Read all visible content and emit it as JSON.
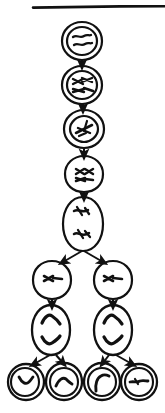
{
  "page": {
    "title": "Cell division stages diagram",
    "background_color": "#ffffff",
    "ink_color": "#111111",
    "width": 165,
    "height": 413
  },
  "divider": {
    "name": "top-horizontal-rule",
    "x1": 33,
    "x2": 165,
    "y": 7,
    "thickness": 2.4,
    "color": "#111111"
  },
  "diagram": {
    "type": "flow",
    "style": "hand-drawn line art",
    "stage_count": 9,
    "arrow_count": 12,
    "stages": [
      {
        "id": "stage-1",
        "label": "interphase-cell",
        "shape": "double-circle",
        "cx": 82,
        "cy": 41,
        "rx": 20,
        "ry": 19,
        "inner_rx": 15,
        "inner_ry": 14,
        "contents": "two-squiggly-chromatin-strands",
        "row": 1,
        "column": 1
      },
      {
        "id": "stage-2",
        "label": "prophase-cell",
        "shape": "double-circle",
        "cx": 82,
        "cy": 85,
        "rx": 20,
        "ry": 19,
        "inner_rx": 15,
        "inner_ry": 14,
        "contents": "four-condensing-chromosomes",
        "row": 2,
        "column": 1
      },
      {
        "id": "stage-3",
        "label": "prometaphase-cell",
        "shape": "double-circle",
        "cx": 84,
        "cy": 129,
        "rx": 20,
        "ry": 19,
        "inner_rx": 14,
        "inner_ry": 13,
        "contents": "paired-chromosomes-crossing",
        "row": 3,
        "column": 1
      },
      {
        "id": "stage-4",
        "label": "metaphase-cell",
        "shape": "single-circle",
        "cx": 84,
        "cy": 174,
        "rx": 19,
        "ry": 18,
        "contents": "chromosomes-aligned-at-equator",
        "row": 4,
        "column": 1
      },
      {
        "id": "stage-5",
        "label": "anaphase-cell",
        "shape": "vertical-oval",
        "cx": 83,
        "cy": 224,
        "rx": 20,
        "ry": 27,
        "contents": "two-chromosome-sets-separating",
        "row": 5,
        "column": 1
      },
      {
        "id": "stage-6",
        "label": "daughter-cell-left",
        "shape": "single-circle",
        "cx": 52,
        "cy": 280,
        "rx": 19,
        "ry": 19,
        "contents": "chromosome-pair-at-equator",
        "row": 6,
        "column": 1
      },
      {
        "id": "stage-7",
        "label": "daughter-cell-right",
        "shape": "single-circle",
        "cx": 113,
        "cy": 280,
        "rx": 19,
        "ry": 19,
        "contents": "chromosome-pair-at-equator",
        "row": 6,
        "column": 2
      },
      {
        "id": "stage-8",
        "label": "dividing-cell-left",
        "shape": "vertical-oval",
        "cx": 51,
        "cy": 330,
        "rx": 19,
        "ry": 25,
        "contents": "two-arc-chromosome-groups",
        "row": 7,
        "column": 1
      },
      {
        "id": "stage-9",
        "label": "dividing-cell-right",
        "shape": "vertical-oval",
        "cx": 113,
        "cy": 330,
        "rx": 19,
        "ry": 25,
        "contents": "two-arc-chromosome-groups",
        "row": 7,
        "column": 2
      }
    ],
    "gametes": [
      {
        "id": "gamete-1",
        "label": "haploid-cell-1",
        "shape": "double-circle",
        "cx": 26,
        "cy": 382,
        "rx": 18,
        "ry": 18,
        "inner_rx": 13,
        "inner_ry": 13,
        "contents": "single-v-shaped-chromosome",
        "row": 8,
        "column": 1
      },
      {
        "id": "gamete-2",
        "label": "haploid-cell-2",
        "shape": "double-circle",
        "cx": 64,
        "cy": 382,
        "rx": 18,
        "ry": 18,
        "inner_rx": 13,
        "inner_ry": 13,
        "contents": "single-caret-shaped-chromosome",
        "row": 8,
        "column": 2
      },
      {
        "id": "gamete-3",
        "label": "haploid-cell-3",
        "shape": "double-circle",
        "cx": 102,
        "cy": 382,
        "rx": 18,
        "ry": 18,
        "inner_rx": 13,
        "inner_ry": 13,
        "contents": "single-hook-shaped-chromosome",
        "row": 8,
        "column": 3
      },
      {
        "id": "gamete-4",
        "label": "haploid-cell-4",
        "shape": "double-circle",
        "cx": 139,
        "cy": 382,
        "rx": 18,
        "ry": 18,
        "inner_rx": 13,
        "inner_ry": 13,
        "contents": "single-horizontal-chromosome",
        "row": 8,
        "column": 4
      }
    ],
    "arrows": [
      {
        "id": "arrow-1",
        "from": "stage-1",
        "to": "stage-2",
        "x1": 82,
        "y1": 60,
        "x2": 82,
        "y2": 65
      },
      {
        "id": "arrow-2",
        "from": "stage-2",
        "to": "stage-3",
        "x1": 83,
        "y1": 104,
        "x2": 83,
        "y2": 109
      },
      {
        "id": "arrow-3",
        "from": "stage-3",
        "to": "stage-4",
        "x1": 84,
        "y1": 148,
        "x2": 84,
        "y2": 155
      },
      {
        "id": "arrow-4",
        "from": "stage-4",
        "to": "stage-5",
        "x1": 84,
        "y1": 192,
        "x2": 84,
        "y2": 197
      },
      {
        "id": "arrow-5",
        "from": "stage-5",
        "to": "stage-6",
        "x1": 83,
        "y1": 251,
        "x2": 62,
        "y2": 262
      },
      {
        "id": "arrow-6",
        "from": "stage-5",
        "to": "stage-7",
        "x1": 83,
        "y1": 251,
        "x2": 104,
        "y2": 262
      },
      {
        "id": "arrow-7",
        "from": "stage-6",
        "to": "stage-8",
        "x1": 52,
        "y1": 299,
        "x2": 52,
        "y2": 305
      },
      {
        "id": "arrow-8",
        "from": "stage-7",
        "to": "stage-9",
        "x1": 113,
        "y1": 299,
        "x2": 113,
        "y2": 305
      },
      {
        "id": "arrow-9",
        "from": "stage-8",
        "to": "gamete-1",
        "x1": 51,
        "y1": 355,
        "x2": 33,
        "y2": 365
      },
      {
        "id": "arrow-10",
        "from": "stage-8",
        "to": "gamete-2",
        "x1": 57,
        "y1": 355,
        "x2": 64,
        "y2": 364
      },
      {
        "id": "arrow-11",
        "from": "stage-9",
        "to": "gamete-3",
        "x1": 108,
        "y1": 355,
        "x2": 102,
        "y2": 364
      },
      {
        "id": "arrow-12",
        "from": "stage-9",
        "to": "gamete-4",
        "x1": 116,
        "y1": 355,
        "x2": 133,
        "y2": 365
      }
    ]
  }
}
